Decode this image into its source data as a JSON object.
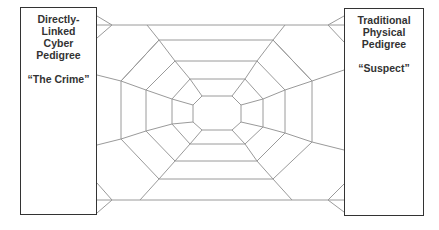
{
  "diagram": {
    "type": "web-connection",
    "line_color": "#999999",
    "border_color": "#333333",
    "left_box": {
      "lines": [
        "Directly-",
        "Linked",
        "Cyber",
        "Pedigree"
      ],
      "quote": "“The Crime”"
    },
    "right_box": {
      "lines": [
        "Traditional",
        "Physical",
        "Pedigree"
      ],
      "quote": "“Suspect”"
    },
    "web": {
      "ring_count": 4,
      "description": "Spider-web of concentric octagons connecting the two boxes"
    }
  }
}
